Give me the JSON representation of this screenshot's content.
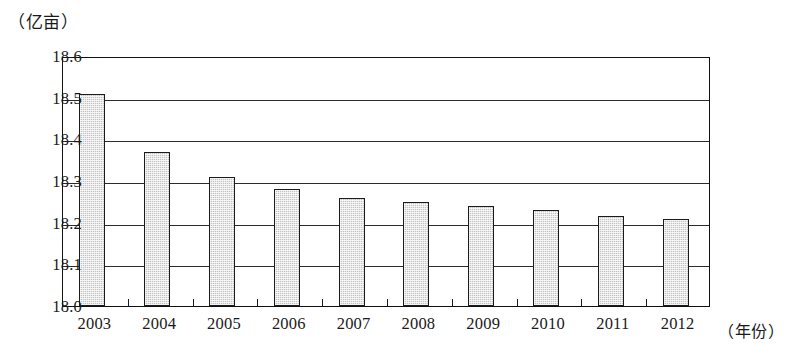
{
  "chart_data": {
    "type": "bar",
    "title": "",
    "ylabel": "（亿亩）",
    "xlabel": "（年份）",
    "categories": [
      "2003",
      "2004",
      "2005",
      "2006",
      "2007",
      "2008",
      "2009",
      "2010",
      "2011",
      "2012"
    ],
    "values": [
      18.51,
      18.37,
      18.31,
      18.28,
      18.26,
      18.25,
      18.24,
      18.23,
      18.215,
      18.21
    ],
    "ylim": [
      18.0,
      18.6
    ],
    "ytick_labels": [
      "18.6",
      "18.5",
      "18.4",
      "18.3",
      "18.2",
      "18.1",
      "18.0"
    ],
    "ytick_values": [
      18.6,
      18.5,
      18.4,
      18.3,
      18.2,
      18.1,
      18.0
    ],
    "grid": true,
    "legend": null,
    "series": [
      {
        "name": "耕地面积",
        "values": [
          18.51,
          18.37,
          18.31,
          18.28,
          18.26,
          18.25,
          18.24,
          18.23,
          18.215,
          18.21
        ]
      }
    ],
    "bar_color": "#c3c3c3",
    "bar_edge_color": "#1b1b1b",
    "axis_color": "#111111"
  }
}
